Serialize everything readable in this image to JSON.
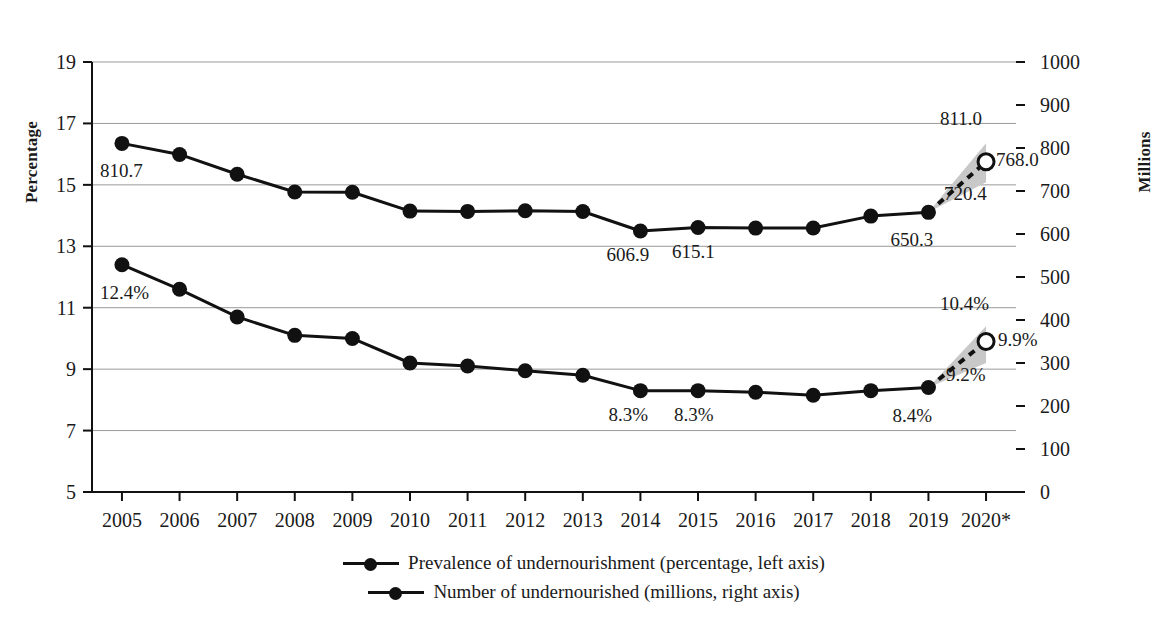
{
  "chart_data": {
    "type": "line",
    "title": "",
    "subtitle": "",
    "xlabel": "",
    "ylabel": "Percentage",
    "y2label": "Millions",
    "grid": true,
    "legend_position": "bottom",
    "x": [
      "2005",
      "2006",
      "2007",
      "2008",
      "2009",
      "2010",
      "2011",
      "2012",
      "2013",
      "2014",
      "2015",
      "2016",
      "2017",
      "2018",
      "2019",
      "2020*"
    ],
    "ylim": [
      5,
      19
    ],
    "yticks": [
      5,
      7,
      9,
      11,
      13,
      15,
      17,
      19
    ],
    "ytick_labels": [
      "5",
      "7",
      "9",
      "11",
      "13",
      "15",
      "17",
      "19"
    ],
    "y2lim": [
      0,
      1000
    ],
    "y2ticks": [
      0,
      100,
      200,
      300,
      400,
      500,
      600,
      700,
      800,
      900,
      1000
    ],
    "y2tick_labels": [
      "0",
      "100",
      "200",
      "300",
      "400",
      "500",
      "600",
      "700",
      "800",
      "900",
      "1000"
    ],
    "gridlines": [
      7,
      9,
      11,
      13,
      15,
      17,
      19
    ],
    "series": [
      {
        "name": "Number of undernourished (millions, right axis)",
        "axis": "right",
        "unit": "millions",
        "values": [
          810.7,
          785.0,
          738.9,
          697.8,
          697.1,
          653.3,
          652.6,
          654.0,
          652.4,
          606.9,
          615.1,
          613.7,
          614.0,
          641.6,
          650.3,
          null
        ],
        "projection": {
          "year": "2020*",
          "value": 768.0,
          "low": 720.4,
          "high": 811.0,
          "style": "dashed",
          "marker": "open-circle"
        },
        "labels": [
          {
            "x": "2005",
            "text": "810.7"
          },
          {
            "x": "2014",
            "text": "606.9"
          },
          {
            "x": "2015",
            "text": "615.1"
          },
          {
            "x": "2019",
            "text": "650.3"
          },
          {
            "x": "2020*",
            "text": "720.4"
          },
          {
            "x": "2020*",
            "text": "768.0"
          },
          {
            "x": "2020*",
            "text": "811.0"
          }
        ]
      },
      {
        "name": "Prevalence of undernourishment (percentage, left axis)",
        "axis": "left",
        "unit": "percentage",
        "values": [
          12.4,
          11.6,
          10.7,
          10.1,
          10.0,
          9.2,
          9.1,
          8.95,
          8.8,
          8.3,
          8.3,
          8.25,
          8.15,
          8.3,
          8.4,
          null
        ],
        "projection": {
          "year": "2020*",
          "value": 9.9,
          "low": 9.2,
          "high": 10.4,
          "style": "dashed",
          "marker": "open-circle"
        },
        "labels": [
          {
            "x": "2005",
            "text": "12.4%"
          },
          {
            "x": "2014",
            "text": "8.3%"
          },
          {
            "x": "2015",
            "text": "8.3%"
          },
          {
            "x": "2019",
            "text": "8.4%"
          },
          {
            "x": "2020*",
            "text": "9.2%"
          },
          {
            "x": "2020*",
            "text": "9.9%"
          },
          {
            "x": "2020*",
            "text": "10.4%"
          }
        ]
      }
    ],
    "colors": {
      "line": "#111111",
      "marker": "#111111",
      "band": "#c8c8c8",
      "grid": "#9a9a9a",
      "axis": "#111111"
    }
  },
  "axes": {
    "left_title": "Percentage",
    "right_title": "Millions"
  },
  "legend": {
    "items": [
      {
        "label": "Prevalence of undernourishment (percentage, left axis)"
      },
      {
        "label": "Number of undernourished (millions, right axis)"
      }
    ]
  },
  "data_labels": {
    "millions": {
      "y2005": "810.7",
      "y2014": "606.9",
      "y2015": "615.1",
      "y2019": "650.3",
      "low2020": "720.4",
      "mid2020": "768.0",
      "high2020": "811.0"
    },
    "percentage": {
      "y2005": "12.4%",
      "y2014": "8.3%",
      "y2015": "8.3%",
      "y2019": "8.4%",
      "low2020": "9.2%",
      "mid2020": "9.9%",
      "high2020": "10.4%"
    }
  }
}
